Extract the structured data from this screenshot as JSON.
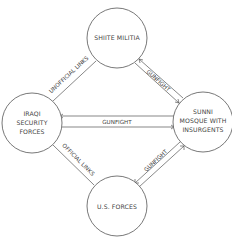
{
  "nodes": {
    "shiite": {
      "lines": [
        "SHIITE MILITIA"
      ]
    },
    "iraqi": {
      "lines": [
        "IRAQI",
        "SECURITY",
        "FORCES"
      ]
    },
    "sunni": {
      "lines": [
        "SUNNI",
        "MOSQUE WITH",
        "INSURGENTS"
      ]
    },
    "us": {
      "lines": [
        "U.S. FORCES"
      ]
    }
  },
  "edges": {
    "iraqi_shiite": {
      "label": "UNOFFICIAL LINKS",
      "style": "line"
    },
    "shiite_sunni": {
      "label": "GUNFIGHT",
      "style": "double-arrow"
    },
    "iraqi_sunni": {
      "label": "GUNFIGHT",
      "style": "double-arrow"
    },
    "iraqi_us": {
      "label": "OFFICIAL LINKS",
      "style": "line"
    },
    "us_sunni": {
      "label": "GUNFIGHT",
      "style": "double-arrow"
    }
  }
}
